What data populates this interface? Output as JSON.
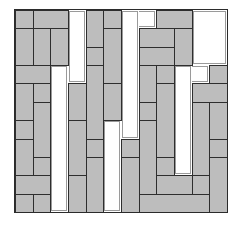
{
  "puzzle": {
    "title": "",
    "grid": {
      "columns": 12,
      "rows": 11
    },
    "colors": {
      "tile_fill": "#bdbdbd",
      "tile_border": "#2e2e2e",
      "channel": "#ffffff"
    },
    "tiles": [
      {
        "c": 0,
        "r": 0,
        "w": 1,
        "h": 1
      },
      {
        "c": 1,
        "r": 0,
        "w": 2,
        "h": 1
      },
      {
        "c": 0,
        "r": 1,
        "w": 1,
        "h": 2
      },
      {
        "c": 1,
        "r": 1,
        "w": 1,
        "h": 2
      },
      {
        "c": 2,
        "r": 1,
        "w": 1,
        "h": 2
      },
      {
        "c": 0,
        "r": 3,
        "w": 2,
        "h": 1
      },
      {
        "c": 0,
        "r": 4,
        "w": 1,
        "h": 2
      },
      {
        "c": 1,
        "r": 4,
        "w": 1,
        "h": 1
      },
      {
        "c": 1,
        "r": 5,
        "w": 1,
        "h": 3
      },
      {
        "c": 0,
        "r": 6,
        "w": 1,
        "h": 1
      },
      {
        "c": 0,
        "r": 7,
        "w": 1,
        "h": 2
      },
      {
        "c": 1,
        "r": 8,
        "w": 1,
        "h": 1
      },
      {
        "c": 0,
        "r": 9,
        "w": 2,
        "h": 1
      },
      {
        "c": 0,
        "r": 10,
        "w": 1,
        "h": 1
      },
      {
        "c": 1,
        "r": 10,
        "w": 1,
        "h": 1
      },
      {
        "c": 3,
        "r": 4,
        "w": 1,
        "h": 2
      },
      {
        "c": 3,
        "r": 6,
        "w": 1,
        "h": 3
      },
      {
        "c": 3,
        "r": 9,
        "w": 1,
        "h": 2
      },
      {
        "c": 4,
        "r": 0,
        "w": 1,
        "h": 2
      },
      {
        "c": 4,
        "r": 2,
        "w": 1,
        "h": 1
      },
      {
        "c": 4,
        "r": 3,
        "w": 1,
        "h": 4
      },
      {
        "c": 4,
        "r": 7,
        "w": 1,
        "h": 1
      },
      {
        "c": 4,
        "r": 8,
        "w": 1,
        "h": 3
      },
      {
        "c": 5,
        "r": 0,
        "w": 1,
        "h": 1
      },
      {
        "c": 5,
        "r": 1,
        "w": 1,
        "h": 3
      },
      {
        "c": 5,
        "r": 4,
        "w": 1,
        "h": 2
      },
      {
        "c": 6,
        "r": 7,
        "w": 1,
        "h": 1
      },
      {
        "c": 6,
        "r": 8,
        "w": 1,
        "h": 3
      },
      {
        "c": 8,
        "r": 0,
        "w": 2,
        "h": 1
      },
      {
        "c": 7,
        "r": 1,
        "w": 2,
        "h": 1
      },
      {
        "c": 7,
        "r": 2,
        "w": 2,
        "h": 1
      },
      {
        "c": 9,
        "r": 1,
        "w": 1,
        "h": 2
      },
      {
        "c": 7,
        "r": 3,
        "w": 1,
        "h": 2
      },
      {
        "c": 7,
        "r": 5,
        "w": 1,
        "h": 1
      },
      {
        "c": 7,
        "r": 6,
        "w": 1,
        "h": 4
      },
      {
        "c": 7,
        "r": 10,
        "w": 4,
        "h": 1
      },
      {
        "c": 8,
        "r": 3,
        "w": 1,
        "h": 1
      },
      {
        "c": 8,
        "r": 4,
        "w": 1,
        "h": 4
      },
      {
        "c": 8,
        "r": 8,
        "w": 1,
        "h": 1
      },
      {
        "c": 8,
        "r": 9,
        "w": 2,
        "h": 1
      },
      {
        "c": 10,
        "r": 9,
        "w": 1,
        "h": 1
      },
      {
        "c": 10,
        "r": 4,
        "w": 2,
        "h": 1
      },
      {
        "c": 10,
        "r": 5,
        "w": 1,
        "h": 4
      },
      {
        "c": 11,
        "r": 3,
        "w": 1,
        "h": 1
      },
      {
        "c": 11,
        "r": 5,
        "w": 1,
        "h": 2
      },
      {
        "c": 11,
        "r": 7,
        "w": 1,
        "h": 1
      },
      {
        "c": 11,
        "r": 8,
        "w": 1,
        "h": 3
      }
    ],
    "channels": [
      {
        "name": "channel-left",
        "cells": [
          [
            3,
            0,
            1,
            4
          ],
          [
            2,
            3,
            1,
            8
          ]
        ]
      },
      {
        "name": "channel-middle",
        "cells": [
          [
            6,
            0,
            2,
            1
          ],
          [
            6,
            0,
            1,
            7
          ],
          [
            5,
            6,
            1,
            5
          ]
        ]
      },
      {
        "name": "channel-right",
        "cells": [
          [
            10,
            0,
            2,
            3
          ],
          [
            9,
            3,
            2,
            1
          ],
          [
            9,
            3,
            1,
            6
          ]
        ]
      }
    ]
  }
}
